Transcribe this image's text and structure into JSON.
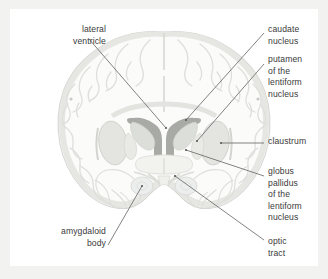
{
  "figure": {
    "background_color": "#f2f2f0",
    "panel_color": "#ffffff",
    "label_color": "#3a3a3a",
    "leader_line_color": "#6b6b6b"
  },
  "palette": {
    "cortex_fill": "#fbfbfa",
    "cortex_outline": "#d9dad6",
    "gyri_line": "#dedfdb",
    "white_matter": "#fdfdfc",
    "ventricle_fill": "#a8aaa6",
    "putamen_fill": "#e4e5e1",
    "putamen_outline": "#cfd0cc",
    "caudate_fill": "#dcdeda",
    "thalamus_fill": "#eff0ec",
    "amygdala_fill": "#eceded"
  },
  "labels": [
    {
      "id": "lateral-ventricle",
      "text_lines": [
        "lateral",
        "ventricle"
      ],
      "align": "right",
      "x": 22,
      "y": 24,
      "width": 84
    },
    {
      "id": "caudate-nucleus",
      "text_lines": [
        "caudate",
        "nucleus"
      ],
      "align": "left",
      "x": 268,
      "y": 24,
      "width": 60
    },
    {
      "id": "putamen-of-the-lentiform-nucleus",
      "text_lines": [
        "putamen",
        "of the",
        "lentiform",
        "nucleus"
      ],
      "align": "left",
      "x": 268,
      "y": 54,
      "width": 60
    },
    {
      "id": "claustrum",
      "text_lines": [
        "claustrum"
      ],
      "align": "left",
      "x": 268,
      "y": 136,
      "width": 60
    },
    {
      "id": "globus-pallidus-of-the-lentiform-nucleus",
      "text_lines": [
        "globus",
        "pallidus",
        "of the",
        "lentiform",
        "nucleus"
      ],
      "align": "left",
      "x": 268,
      "y": 166,
      "width": 60
    },
    {
      "id": "optic-tract",
      "text_lines": [
        "optic",
        "tract"
      ],
      "align": "left",
      "x": 268,
      "y": 236,
      "width": 60
    },
    {
      "id": "amygdaloid-body",
      "text_lines": [
        "amygdaloid",
        "body"
      ],
      "align": "right",
      "x": 16,
      "y": 226,
      "width": 90
    }
  ],
  "leader_lines": [
    {
      "id": "leader-lateral-ventricle",
      "x1": 89,
      "y1": 39,
      "x2": 166,
      "y2": 128
    },
    {
      "id": "leader-caudate-nucleus",
      "x1": 264,
      "y1": 33,
      "x2": 186,
      "y2": 120
    },
    {
      "id": "leader-putamen",
      "x1": 264,
      "y1": 64,
      "x2": 197,
      "y2": 141
    },
    {
      "id": "leader-claustrum",
      "x1": 264,
      "y1": 143,
      "x2": 221,
      "y2": 143
    },
    {
      "id": "leader-globus-pallidus",
      "x1": 264,
      "y1": 176,
      "x2": 186,
      "y2": 150
    },
    {
      "id": "leader-optic-tract",
      "x1": 264,
      "y1": 240,
      "x2": 175,
      "y2": 176
    },
    {
      "id": "leader-amygdaloid-body",
      "x1": 108,
      "y1": 245,
      "x2": 142,
      "y2": 186
    }
  ]
}
